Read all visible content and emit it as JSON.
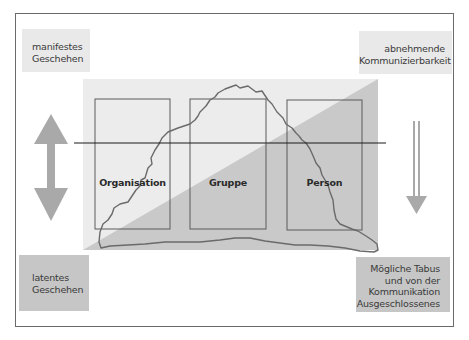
{
  "diagram": {
    "type": "iceberg-communication-model",
    "corners": {
      "top_left": {
        "lines": [
          "manifestes",
          "Geschehen"
        ]
      },
      "top_right": {
        "lines": [
          "abnehmende",
          "Kommunizierbarkeit"
        ]
      },
      "bottom_left": {
        "lines": [
          "latentes",
          "Geschehen"
        ]
      },
      "bottom_right": {
        "lines": [
          "Mögliche Tabus",
          "und von der",
          "Kommunikation",
          "Ausgeschlossenes"
        ]
      }
    },
    "levels": [
      {
        "label": "Organisation"
      },
      {
        "label": "Gruppe"
      },
      {
        "label": "Person"
      }
    ],
    "arrows": {
      "left": "double-headed-vertical",
      "right": "downward-hollow"
    },
    "colors": {
      "light_fill": "#ececec",
      "dark_fill": "#c9c9c9",
      "corner_top_fill": "#e9e9e9",
      "corner_bottom_fill": "#c6c6c6",
      "arrow": "#a9a9a9",
      "line": "#1a1a1a",
      "outline": "#6a6a6a"
    }
  }
}
